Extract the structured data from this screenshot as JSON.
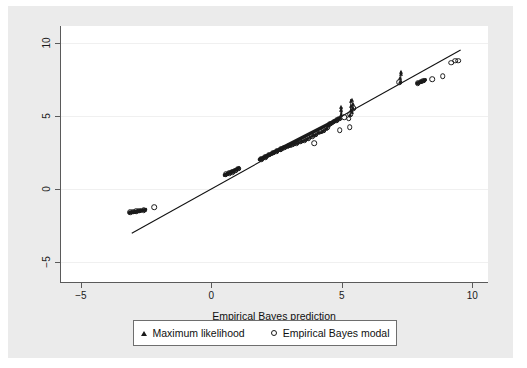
{
  "figure": {
    "background": "#ebebeb",
    "plot_background": "#ffffff",
    "axis_color": "#5a5a5a",
    "marker_color": "#1a1a1a"
  },
  "axis": {
    "x_title": "Empirical Bayes prediction",
    "y_title": "",
    "x_ticks": [
      "-5",
      "0",
      "5",
      "10"
    ],
    "y_ticks": [
      "-5",
      "0",
      "5",
      "10"
    ]
  },
  "legend": {
    "items": [
      {
        "label": "Maximum likelihood",
        "marker": "triangle"
      },
      {
        "label": "Empirical Bayes modal",
        "marker": "circle"
      }
    ]
  },
  "chart_data": {
    "type": "scatter",
    "title": "",
    "xlabel": "Empirical Bayes prediction",
    "ylabel": "",
    "xlim": [
      -5.8,
      10.6
    ],
    "ylim": [
      -6.4,
      11.2
    ],
    "xticks": [
      -5,
      0,
      5,
      10
    ],
    "yticks": [
      -5,
      0,
      5,
      10
    ],
    "grid": "horizontal-faint",
    "legend_position": "below-plot",
    "reference_line": {
      "label": "identity line",
      "slope": 1,
      "intercept": 0,
      "x_from": -3.05,
      "x_to": 9.55
    },
    "series": [
      {
        "name": "Maximum likelihood",
        "marker": "triangle",
        "points": [
          [
            -3.12,
            -1.62
          ],
          [
            -3.05,
            -1.6
          ],
          [
            -2.98,
            -1.58
          ],
          [
            -2.92,
            -1.56
          ],
          [
            -2.86,
            -1.54
          ],
          [
            -2.8,
            -1.52
          ],
          [
            -2.74,
            -1.5
          ],
          [
            -2.68,
            -1.48
          ],
          [
            -2.62,
            -1.46
          ],
          [
            -2.56,
            -1.44
          ],
          [
            0.52,
            0.98
          ],
          [
            0.58,
            1.02
          ],
          [
            0.64,
            1.06
          ],
          [
            0.7,
            1.1
          ],
          [
            0.76,
            1.14
          ],
          [
            0.82,
            1.18
          ],
          [
            0.88,
            1.24
          ],
          [
            0.94,
            1.3
          ],
          [
            1.0,
            1.36
          ],
          [
            1.04,
            1.42
          ],
          [
            1.86,
            2.04
          ],
          [
            1.92,
            2.08
          ],
          [
            1.98,
            2.12
          ],
          [
            2.04,
            2.18
          ],
          [
            2.1,
            2.24
          ],
          [
            2.16,
            2.3
          ],
          [
            2.22,
            2.36
          ],
          [
            2.28,
            2.42
          ],
          [
            2.34,
            2.48
          ],
          [
            2.4,
            2.54
          ],
          [
            2.46,
            2.58
          ],
          [
            2.52,
            2.62
          ],
          [
            2.58,
            2.66
          ],
          [
            2.64,
            2.7
          ],
          [
            2.7,
            2.74
          ],
          [
            2.76,
            2.8
          ],
          [
            2.82,
            2.86
          ],
          [
            2.88,
            2.9
          ],
          [
            2.94,
            2.94
          ],
          [
            3.0,
            2.98
          ],
          [
            3.06,
            3.02
          ],
          [
            3.12,
            3.06
          ],
          [
            3.18,
            3.1
          ],
          [
            3.24,
            3.14
          ],
          [
            3.3,
            3.18
          ],
          [
            3.36,
            3.22
          ],
          [
            3.42,
            3.26
          ],
          [
            3.48,
            3.3
          ],
          [
            3.54,
            3.34
          ],
          [
            3.6,
            3.38
          ],
          [
            3.66,
            3.44
          ],
          [
            3.72,
            3.5
          ],
          [
            3.78,
            3.56
          ],
          [
            3.84,
            3.62
          ],
          [
            3.9,
            3.68
          ],
          [
            3.96,
            3.74
          ],
          [
            4.02,
            3.8
          ],
          [
            4.08,
            3.86
          ],
          [
            4.14,
            3.9
          ],
          [
            4.2,
            3.94
          ],
          [
            4.26,
            3.98
          ],
          [
            4.32,
            4.06
          ],
          [
            4.38,
            4.14
          ],
          [
            4.42,
            4.22
          ],
          [
            4.46,
            4.3
          ],
          [
            4.5,
            4.38
          ],
          [
            4.54,
            4.44
          ],
          [
            4.58,
            4.5
          ],
          [
            4.62,
            4.56
          ],
          [
            4.66,
            4.6
          ],
          [
            4.7,
            4.64
          ],
          [
            4.74,
            4.68
          ],
          [
            4.78,
            4.72
          ],
          [
            4.82,
            4.76
          ],
          [
            4.86,
            4.8
          ],
          [
            4.94,
            4.86
          ],
          [
            4.98,
            5.1
          ],
          [
            4.98,
            5.42
          ],
          [
            4.98,
            5.62
          ],
          [
            5.32,
            5.08
          ],
          [
            5.34,
            5.4
          ],
          [
            5.34,
            5.72
          ],
          [
            5.36,
            6.02
          ],
          [
            5.38,
            6.14
          ],
          [
            5.4,
            5.3
          ],
          [
            5.42,
            5.58
          ],
          [
            5.44,
            5.86
          ],
          [
            7.22,
            7.36
          ],
          [
            7.24,
            7.62
          ],
          [
            7.26,
            7.88
          ],
          [
            7.28,
            8.04
          ],
          [
            7.92,
            7.3
          ],
          [
            7.98,
            7.34
          ],
          [
            8.04,
            7.38
          ],
          [
            8.1,
            7.42
          ],
          [
            8.16,
            7.46
          ]
        ]
      },
      {
        "name": "Empirical Bayes modal",
        "marker": "circle",
        "points": [
          [
            -3.1,
            -1.6
          ],
          [
            -3.0,
            -1.58
          ],
          [
            -2.88,
            -1.54
          ],
          [
            -2.76,
            -1.5
          ],
          [
            -2.6,
            -1.46
          ],
          [
            -2.2,
            -1.24
          ],
          [
            0.55,
            1.0
          ],
          [
            0.68,
            1.08
          ],
          [
            0.8,
            1.16
          ],
          [
            0.92,
            1.26
          ],
          [
            1.02,
            1.38
          ],
          [
            1.9,
            2.06
          ],
          [
            2.06,
            2.2
          ],
          [
            2.2,
            2.34
          ],
          [
            2.36,
            2.5
          ],
          [
            2.5,
            2.6
          ],
          [
            2.66,
            2.72
          ],
          [
            2.8,
            2.84
          ],
          [
            2.96,
            2.96
          ],
          [
            3.1,
            3.04
          ],
          [
            3.26,
            3.16
          ],
          [
            3.4,
            3.24
          ],
          [
            3.56,
            3.36
          ],
          [
            3.7,
            3.48
          ],
          [
            3.86,
            3.64
          ],
          [
            4.0,
            3.78
          ],
          [
            4.16,
            3.92
          ],
          [
            4.3,
            4.04
          ],
          [
            4.44,
            4.26
          ],
          [
            4.56,
            4.48
          ],
          [
            4.68,
            4.62
          ],
          [
            4.8,
            4.74
          ],
          [
            4.9,
            4.82
          ],
          [
            3.94,
            3.14
          ],
          [
            4.92,
            4.04
          ],
          [
            5.3,
            4.26
          ],
          [
            5.32,
            5.12
          ],
          [
            5.44,
            5.54
          ],
          [
            5.26,
            4.84
          ],
          [
            5.1,
            4.92
          ],
          [
            7.2,
            7.34
          ],
          [
            7.9,
            7.28
          ],
          [
            8.02,
            7.36
          ],
          [
            8.12,
            7.44
          ],
          [
            8.46,
            7.56
          ],
          [
            8.86,
            7.74
          ],
          [
            9.18,
            8.68
          ],
          [
            9.34,
            8.82
          ],
          [
            9.46,
            8.82
          ]
        ]
      }
    ],
    "dense_segments": [
      {
        "series": "Maximum likelihood",
        "x1": -3.15,
        "y1": -1.64,
        "x2": -2.52,
        "y2": -1.42
      },
      {
        "series": "Maximum likelihood",
        "x1": 0.5,
        "y1": 0.96,
        "x2": 1.06,
        "y2": 1.44
      },
      {
        "series": "Maximum likelihood",
        "x1": 1.84,
        "y1": 2.02,
        "x2": 4.9,
        "y2": 4.84
      },
      {
        "series": "Maximum likelihood",
        "x1": 7.88,
        "y1": 7.26,
        "x2": 8.2,
        "y2": 7.5
      }
    ],
    "spikes": [
      {
        "x": 4.98,
        "y_low": 5.02,
        "y_high": 5.66
      },
      {
        "x": 5.34,
        "y_low": 5.04,
        "y_high": 6.18
      },
      {
        "x": 5.42,
        "y_low": 5.28,
        "y_high": 5.9
      },
      {
        "x": 7.25,
        "y_low": 7.3,
        "y_high": 8.08
      }
    ]
  }
}
